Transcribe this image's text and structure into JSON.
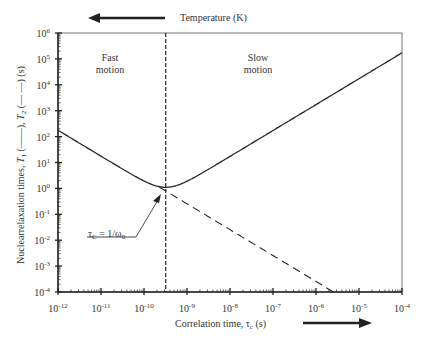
{
  "chart_data": {
    "type": "line",
    "title": "",
    "xlabel": "Correlation time, τc (s)",
    "ylabel": "Nuclearrelaxation times, T1 (——), T2 (— —) (s)",
    "top_label": "Temperature (K)",
    "x_scale": "log",
    "y_scale": "log",
    "xlim": [
      1e-12,
      0.0001
    ],
    "ylim": [
      0.0001,
      1000000.0
    ],
    "x_tick_labels": [
      "10-12",
      "10-11",
      "10-10",
      "10-9",
      "10-8",
      "10-7",
      "10-6",
      "10-5",
      "10-4"
    ],
    "y_tick_labels": [
      "10-4",
      "10-3",
      "10-2",
      "10-1",
      "100",
      "101",
      "102",
      "103",
      "104",
      "105",
      "106"
    ],
    "grid": false,
    "annotations": [
      {
        "text": "Fast motion",
        "x": 3e-12,
        "y": 30000.0
      },
      {
        "text": "Slow motion",
        "x": 1e-08,
        "y": 30000.0
      },
      {
        "text": "τC = 1/ω0",
        "x": 3.2e-10,
        "y": 0.8,
        "arrow": true
      },
      {
        "text": "dashed vertical line at τc = 1/ω0",
        "x": 3.2e-10
      }
    ],
    "series": [
      {
        "name": "T1 (solid)",
        "style": "solid",
        "x": [
          1e-12,
          1e-11,
          1e-10,
          2e-10,
          3.2e-10,
          5e-10,
          1e-09,
          1e-08,
          1e-07,
          1e-06,
          1e-05,
          0.0001
        ],
        "y": [
          230,
          22,
          2.3,
          1.4,
          1.1,
          1.3,
          2.5,
          25,
          250,
          2500,
          25000,
          200000
        ]
      },
      {
        "name": "T2 (dashed)",
        "style": "dashed",
        "x": [
          1e-12,
          1e-11,
          1e-10,
          3.2e-10,
          1e-09,
          1e-08,
          1e-07,
          1e-06,
          2.8e-06
        ],
        "y": [
          230,
          22,
          2.3,
          0.8,
          0.25,
          0.025,
          0.0025,
          0.00025,
          0.0001
        ]
      }
    ]
  },
  "labels": {
    "fast": [
      "Fast",
      "motion"
    ],
    "slow": [
      "Slow",
      "motion"
    ],
    "top": "Temperature (K)",
    "xlabel": "Correlation time, τc (s)",
    "ylabel": "Nuclearrelaxation times, T1 (——), T2 (— —) (s)",
    "annotation": "τC = 1/ω0"
  }
}
